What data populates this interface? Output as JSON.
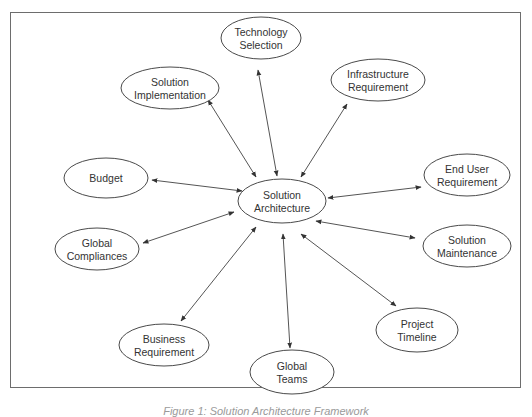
{
  "diagram": {
    "type": "hub-and-spoke",
    "center": {
      "id": "center",
      "lines": [
        "Solution",
        "Architecture"
      ],
      "cx": 282,
      "cy": 201,
      "rx": 44,
      "ry": 22
    },
    "nodes": [
      {
        "id": "technology-selection",
        "lines": [
          "Technology",
          "Selection"
        ],
        "cx": 261,
        "cy": 38,
        "rx": 40,
        "ry": 21
      },
      {
        "id": "solution-implementation",
        "lines": [
          "Solution",
          "Implementation"
        ],
        "cx": 170,
        "cy": 88,
        "rx": 49,
        "ry": 21
      },
      {
        "id": "infrastructure-requirement",
        "lines": [
          "Infrastructure",
          "Requirement"
        ],
        "cx": 378,
        "cy": 80,
        "rx": 47,
        "ry": 21
      },
      {
        "id": "budget",
        "lines": [
          "Budget"
        ],
        "cx": 106,
        "cy": 178,
        "rx": 42,
        "ry": 20
      },
      {
        "id": "end-user-requirement",
        "lines": [
          "End User",
          "Requirement"
        ],
        "cx": 467,
        "cy": 175,
        "rx": 43,
        "ry": 21
      },
      {
        "id": "global-compliances",
        "lines": [
          "Global",
          "Compliances"
        ],
        "cx": 97,
        "cy": 249,
        "rx": 42,
        "ry": 21
      },
      {
        "id": "solution-maintenance",
        "lines": [
          "Solution",
          "Maintenance"
        ],
        "cx": 467,
        "cy": 246,
        "rx": 44,
        "ry": 21
      },
      {
        "id": "business-requirement",
        "lines": [
          "Business",
          "Requirement"
        ],
        "cx": 164,
        "cy": 345,
        "rx": 45,
        "ry": 21
      },
      {
        "id": "global-teams",
        "lines": [
          "Global",
          "Teams"
        ],
        "cx": 292,
        "cy": 372,
        "rx": 42,
        "ry": 22
      },
      {
        "id": "project-timeline",
        "lines": [
          "Project",
          "Timeline"
        ],
        "cx": 417,
        "cy": 330,
        "rx": 41,
        "ry": 22
      }
    ],
    "edges": [
      {
        "to": "technology-selection",
        "x1": 258,
        "y1": 70,
        "x2": 277,
        "y2": 176
      },
      {
        "to": "solution-implementation",
        "x1": 208,
        "y1": 100,
        "x2": 256,
        "y2": 177
      },
      {
        "to": "infrastructure-requirement",
        "x1": 347,
        "y1": 104,
        "x2": 301,
        "y2": 177
      },
      {
        "to": "budget",
        "x1": 152,
        "y1": 180,
        "x2": 242,
        "y2": 191
      },
      {
        "to": "end-user-requirement",
        "x1": 328,
        "y1": 198,
        "x2": 421,
        "y2": 187
      },
      {
        "to": "global-compliances",
        "x1": 143,
        "y1": 243,
        "x2": 234,
        "y2": 212
      },
      {
        "to": "solution-maintenance",
        "x1": 316,
        "y1": 221,
        "x2": 415,
        "y2": 238
      },
      {
        "to": "business-requirement",
        "x1": 181,
        "y1": 321,
        "x2": 256,
        "y2": 227
      },
      {
        "to": "global-teams",
        "x1": 290,
        "y1": 348,
        "x2": 283,
        "y2": 234
      },
      {
        "to": "project-timeline",
        "x1": 396,
        "y1": 306,
        "x2": 301,
        "y2": 234
      }
    ]
  },
  "caption": "Figure 1: Solution Architecture Framework"
}
